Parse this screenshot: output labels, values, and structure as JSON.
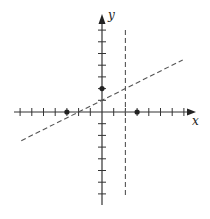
{
  "chart_data": {
    "type": "line",
    "title": "",
    "xlabel": "x",
    "ylabel": "y",
    "xlim": [
      -7,
      7
    ],
    "ylim": [
      -7,
      7
    ],
    "grid": false,
    "ticks_unlabeled": true,
    "series": [
      {
        "name": "slanted-dashed-line",
        "style": "dashed",
        "equation": "y = x/2 + 1",
        "slope": 0.5,
        "intercept": 1,
        "x_range": [
          -6.9,
          6.9
        ]
      },
      {
        "name": "vertical-dashed-line",
        "style": "dashed",
        "equation": "x = 2",
        "x": 2,
        "y_range": [
          -7.2,
          7
        ]
      }
    ],
    "points": [
      {
        "name": "point-neg3-0",
        "x": -3,
        "y": 0
      },
      {
        "name": "point-3-0",
        "x": 3,
        "y": 0
      },
      {
        "name": "point-0-2",
        "x": 0,
        "y": 2
      }
    ]
  }
}
